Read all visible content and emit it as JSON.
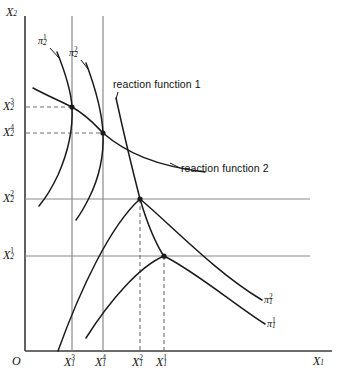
{
  "figure": {
    "type": "diagram",
    "axes": {
      "origin_label": "O",
      "x_axis_label": "X",
      "x_axis_sub": "1",
      "y_axis_label": "X",
      "y_axis_sub": "2"
    },
    "x_ticks": [
      {
        "base": "X",
        "sub": "1",
        "sup": "3",
        "px": 72
      },
      {
        "base": "X",
        "sub": "1",
        "sup": "4",
        "px": 103
      },
      {
        "base": "X",
        "sub": "1",
        "sup": "2",
        "px": 140
      },
      {
        "base": "X",
        "sub": "1",
        "sup": "1",
        "px": 164
      }
    ],
    "y_ticks": [
      {
        "base": "X",
        "sub": "2",
        "sup": "3",
        "px": 107
      },
      {
        "base": "X",
        "sub": "2",
        "sup": "4",
        "px": 133
      },
      {
        "base": "X",
        "sub": "2",
        "sup": "2",
        "px": 199
      },
      {
        "base": "X",
        "sub": "2",
        "sup": "1",
        "px": 256
      }
    ],
    "curve_labels": [
      {
        "name": "reaction-function-1",
        "text": "reaction function 1"
      },
      {
        "name": "reaction-function-2",
        "text": "reaction function 2"
      }
    ],
    "isoprofit_labels": [
      {
        "name": "pi-2-1",
        "base": "π",
        "sub": "2",
        "sup": "1"
      },
      {
        "name": "pi-2-2",
        "base": "π",
        "sub": "2",
        "sup": "2"
      },
      {
        "name": "pi-1-2",
        "base": "π",
        "sub": "1",
        "sup": "2"
      },
      {
        "name": "pi-1-1",
        "base": "π",
        "sub": "1",
        "sup": "1"
      }
    ],
    "tangency_points": [
      {
        "name": "tangency-x3",
        "x": 72,
        "y": 107
      },
      {
        "name": "tangency-x4",
        "x": 103,
        "y": 133
      },
      {
        "name": "tangency-x2",
        "x": 140,
        "y": 199
      },
      {
        "name": "tangency-x1",
        "x": 164,
        "y": 256
      }
    ],
    "colors": {
      "curve": "#1a1a1a",
      "axis": "#3a3a3a",
      "gridline": "#808080",
      "dashed": "#6e6e6e",
      "background": "#ffffff"
    }
  }
}
